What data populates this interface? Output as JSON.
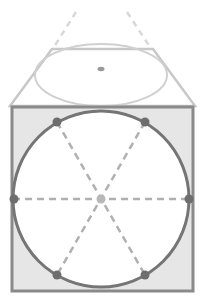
{
  "diagram": {
    "colors": {
      "square_fill": "#e6e6e6",
      "square_stroke": "#8a8a8a",
      "circle_stroke": "#757575",
      "circle_fill": "#ffffff",
      "point_fill": "#6e6e6e",
      "center_fill": "#b8b8b8",
      "dashed": "#b0b0b0",
      "top_face_stroke": "#c8c8c8",
      "top_ellipse_stroke": "#d0d0d0",
      "top_dashed": "#d8d8d8"
    },
    "circle_points_count": 6,
    "diameters_count": 3
  }
}
